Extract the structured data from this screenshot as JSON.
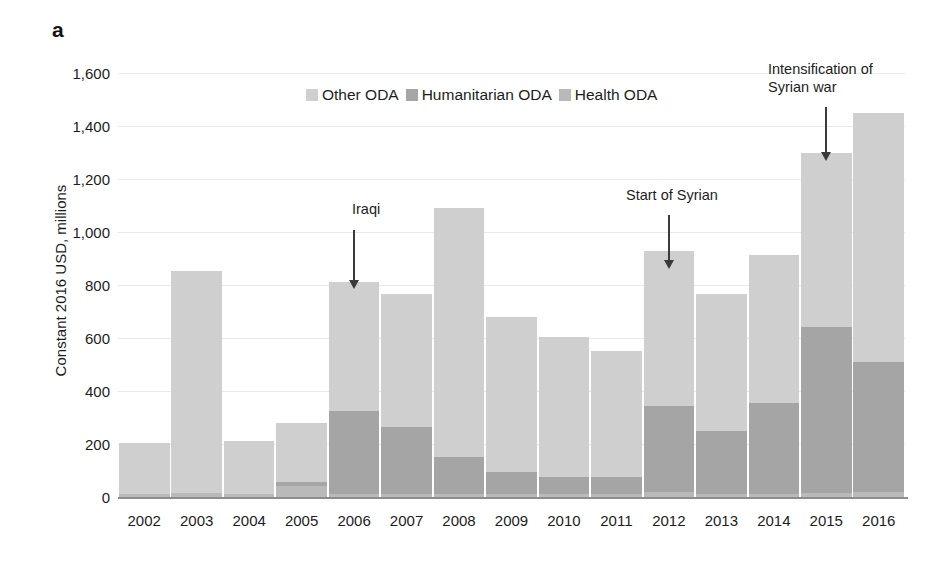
{
  "panel": {
    "letter": "a"
  },
  "legend": {
    "items": [
      {
        "label": "Other ODA",
        "color": "#cfcfcf"
      },
      {
        "label": "Humanitarian ODA",
        "color": "#a5a5a5"
      },
      {
        "label": "Health ODA",
        "color": "#b9b9b9"
      }
    ]
  },
  "annotations": [
    {
      "text": "Iraqi",
      "year": "2006"
    },
    {
      "text": "Start of Syrian",
      "year": "2012"
    },
    {
      "text": "Intensification of\nSyrian war",
      "year": "2015"
    }
  ],
  "chart_data": {
    "type": "bar",
    "stacked": true,
    "title": "",
    "xlabel": "",
    "ylabel": "Constant 2016 USD, millions",
    "ylim": [
      0,
      1600
    ],
    "ytick_labels": [
      "1,600",
      "1,400",
      "1,200",
      "1,000",
      "800",
      "600",
      "400",
      "200",
      "0"
    ],
    "ytick_values": [
      1600,
      1400,
      1200,
      1000,
      800,
      600,
      400,
      200,
      0
    ],
    "grid": true,
    "legend_position": "top-center",
    "categories": [
      "2002",
      "2003",
      "2004",
      "2005",
      "2006",
      "2007",
      "2008",
      "2009",
      "2010",
      "2011",
      "2012",
      "2013",
      "2014",
      "2015",
      "2016"
    ],
    "series": [
      {
        "name": "Health ODA",
        "color": "#b9b9b9",
        "values": [
          12,
          15,
          10,
          40,
          10,
          10,
          10,
          10,
          10,
          10,
          20,
          10,
          10,
          15,
          20
        ]
      },
      {
        "name": "Humanitarian ODA",
        "color": "#a5a5a5",
        "values": [
          0,
          0,
          0,
          15,
          315,
          255,
          140,
          85,
          65,
          65,
          325,
          240,
          345,
          625,
          490
        ]
      },
      {
        "name": "Other ODA",
        "color": "#cfcfcf",
        "values": [
          193,
          838,
          200,
          225,
          485,
          500,
          940,
          585,
          530,
          475,
          585,
          515,
          560,
          660,
          940
        ]
      }
    ],
    "totals": [
      205,
      853,
      210,
      280,
      810,
      765,
      1090,
      680,
      605,
      550,
      930,
      765,
      915,
      1300,
      1450
    ]
  }
}
